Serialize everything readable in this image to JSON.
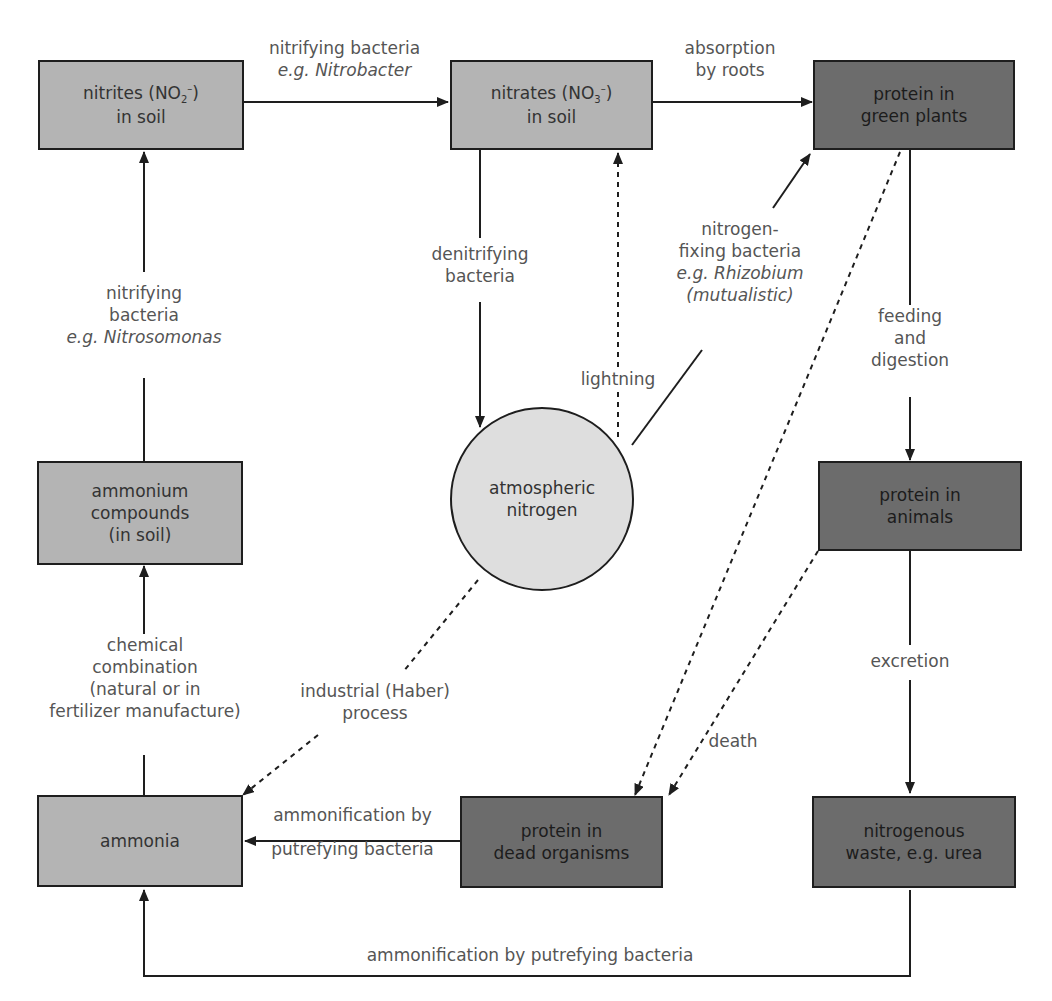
{
  "colors": {
    "light_box": "#b4b4b4",
    "dark_box": "#6c6c6c",
    "circle": "#dedede",
    "line": "#1e1e1e"
  },
  "nodes": {
    "nitrites": {
      "line1_pre": "nitrites (NO",
      "sub": "2",
      "sup": "–",
      "line1_post": ")",
      "line2": "in soil"
    },
    "nitrates": {
      "line1_pre": "nitrates (NO",
      "sub": "3",
      "sup": "–",
      "line1_post": ")",
      "line2": "in soil"
    },
    "protein_plants": {
      "line1": "protein in",
      "line2": "green plants"
    },
    "ammonium": {
      "line1": "ammonium",
      "line2": "compounds",
      "line3": "(in soil)"
    },
    "atmospheric": {
      "line1": "atmospheric",
      "line2": "nitrogen"
    },
    "protein_animals": {
      "line1": "protein in",
      "line2": "animals"
    },
    "ammonia": {
      "line1": "ammonia"
    },
    "protein_dead": {
      "line1": "protein in",
      "line2": "dead organisms"
    },
    "waste": {
      "line1": "nitrogenous",
      "line2": "waste, e.g. urea"
    }
  },
  "labels": {
    "nitrobacter": {
      "line1": "nitrifying bacteria",
      "line2": "e.g. Nitrobacter"
    },
    "absorption": {
      "line1": "absorption",
      "line2": "by roots"
    },
    "nitrosomonas": {
      "line1": "nitrifying",
      "line2": "bacteria",
      "line3": "e.g. Nitrosomonas"
    },
    "denitrifying": {
      "line1": "denitrifying",
      "line2": "bacteria"
    },
    "lightning": {
      "line1": "lightning"
    },
    "fixing": {
      "line1": "nitrogen-",
      "line2": "fixing bacteria",
      "line3": "e.g. Rhizobium",
      "line4": "(mutualistic)"
    },
    "feeding": {
      "line1": "feeding",
      "line2": "and",
      "line3": "digestion"
    },
    "chemical": {
      "line1": "chemical",
      "line2": "combination",
      "line3": "(natural or in",
      "line4": "fertilizer manufacture)"
    },
    "haber": {
      "line1": "industrial (Haber)",
      "line2": "process"
    },
    "death": {
      "line1": "death"
    },
    "excretion": {
      "line1": "excretion"
    },
    "ammonification_dead": {
      "line1": "ammonification by",
      "line2": "putrefying bacteria"
    },
    "ammonification_waste": {
      "line1": "ammonification by putrefying bacteria"
    }
  }
}
